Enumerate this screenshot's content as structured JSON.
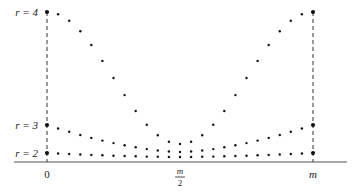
{
  "diagram": {
    "type": "dotted-curves",
    "x_axis": {
      "tick_labels": [
        {
          "text": "0",
          "position": 0
        },
        {
          "text_num": "m",
          "text_den": "2",
          "position": 0.5
        },
        {
          "text": "m",
          "position": 1
        }
      ]
    },
    "curves": [
      {
        "label": "r = 4",
        "end_y": 12,
        "mid_y": 144
      },
      {
        "label": "r = 3",
        "end_y": 125,
        "mid_y": 152
      },
      {
        "label": "r = 2",
        "end_y": 153,
        "mid_y": 157
      }
    ],
    "dots_per_curve": 25,
    "colors": {
      "ink": "#111111",
      "axis": "#555555",
      "dash": "#333333"
    }
  }
}
